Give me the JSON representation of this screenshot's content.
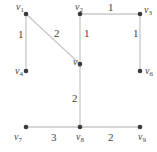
{
  "graph": {
    "nodes": [
      {
        "id": "v1",
        "label": "v",
        "sub": "1",
        "x": 26,
        "y": 14,
        "lx": 16,
        "ly": 10
      },
      {
        "id": "v2",
        "label": "v",
        "sub": "2",
        "x": 80,
        "y": 14,
        "lx": 75,
        "ly": 10
      },
      {
        "id": "v3",
        "label": "v",
        "sub": "3",
        "x": 140,
        "y": 14,
        "lx": 144,
        "ly": 13
      },
      {
        "id": "v4",
        "label": "v",
        "sub": "4",
        "x": 26,
        "y": 71,
        "lx": 15,
        "ly": 74
      },
      {
        "id": "v5",
        "label": "v",
        "sub": "5",
        "x": 80,
        "y": 64,
        "lx": 73,
        "ly": 65
      },
      {
        "id": "v6",
        "label": "v",
        "sub": "6",
        "x": 140,
        "y": 71,
        "lx": 145,
        "ly": 74
      },
      {
        "id": "v7",
        "label": "v",
        "sub": "7",
        "x": 26,
        "y": 127,
        "lx": 14,
        "ly": 140
      },
      {
        "id": "v8",
        "label": "v",
        "sub": "8",
        "x": 80,
        "y": 127,
        "lx": 76,
        "ly": 140
      },
      {
        "id": "v9",
        "label": "v",
        "sub": "9",
        "x": 140,
        "y": 127,
        "lx": 138,
        "ly": 140
      }
    ],
    "edges": [
      {
        "from": "v1",
        "to": "v4",
        "weight": "1",
        "wx": 18,
        "wy": 38
      },
      {
        "from": "v1",
        "to": "v5",
        "weight": "2",
        "wx": 54,
        "wy": 37
      },
      {
        "from": "v2",
        "to": "v3",
        "weight": "1",
        "wx": 108,
        "wy": 11
      },
      {
        "from": "v2",
        "to": "v5",
        "weight": "1",
        "wx": 84,
        "wy": 37
      },
      {
        "from": "v3",
        "to": "v6",
        "weight": "1",
        "wx": 133,
        "wy": 37
      },
      {
        "from": "v5",
        "to": "v8",
        "weight": "2",
        "wx": 72,
        "wy": 102
      },
      {
        "from": "v7",
        "to": "v8",
        "weight": "3",
        "wx": 51,
        "wy": 141
      },
      {
        "from": "v8",
        "to": "v9",
        "weight": "2",
        "wx": 108,
        "wy": 141
      }
    ]
  }
}
